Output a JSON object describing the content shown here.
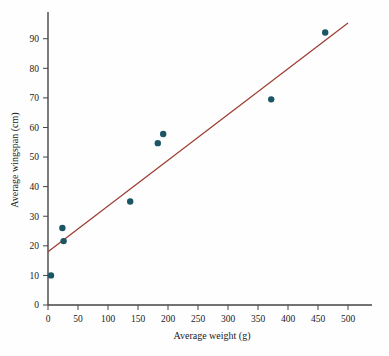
{
  "chart_data": {
    "type": "scatter",
    "title": "",
    "xlabel": "Average weight (g)",
    "ylabel": "Average wingspan (cm)",
    "xlim": [
      0,
      520
    ],
    "ylim": [
      0,
      97
    ],
    "xticks": [
      0,
      50,
      100,
      150,
      200,
      250,
      300,
      350,
      400,
      450,
      500
    ],
    "xtick_labels": [
      "0",
      "50",
      "100",
      "150",
      "200",
      "250",
      "300",
      "350",
      "400",
      "450",
      "500"
    ],
    "yticks": [
      0,
      10,
      20,
      30,
      40,
      50,
      60,
      70,
      80,
      90
    ],
    "ytick_labels": [
      "0",
      "10",
      "20",
      "30",
      "40",
      "50",
      "60",
      "70",
      "80",
      "90"
    ],
    "grid": false,
    "legend": "none",
    "marker_color": "#1b5664",
    "marker_size": 3.2,
    "points": [
      {
        "x": 5,
        "y": 10.0
      },
      {
        "x": 24,
        "y": 26.0
      },
      {
        "x": 26,
        "y": 21.6
      },
      {
        "x": 137,
        "y": 35.0
      },
      {
        "x": 183,
        "y": 54.7
      },
      {
        "x": 192,
        "y": 57.8
      },
      {
        "x": 372,
        "y": 69.5
      },
      {
        "x": 462,
        "y": 92.1
      }
    ],
    "series": [
      {
        "name": "Average wingspan",
        "x": [
          5,
          24,
          26,
          137,
          183,
          192,
          372,
          462
        ],
        "values": [
          10.0,
          26.0,
          21.6,
          35.0,
          54.7,
          57.8,
          69.5,
          92.1
        ]
      }
    ],
    "trendline": {
      "type": "line",
      "color": "#9e3b30",
      "width": 1.2,
      "intercept": 18.0,
      "slope": 0.1545,
      "x_start": 0,
      "x_end": 500,
      "y_start": 18.0,
      "y_end": 95.3
    }
  },
  "axes": {
    "x_axis_name": "x-axis",
    "y_axis_name": "y-axis",
    "axis_color": "#444444"
  }
}
